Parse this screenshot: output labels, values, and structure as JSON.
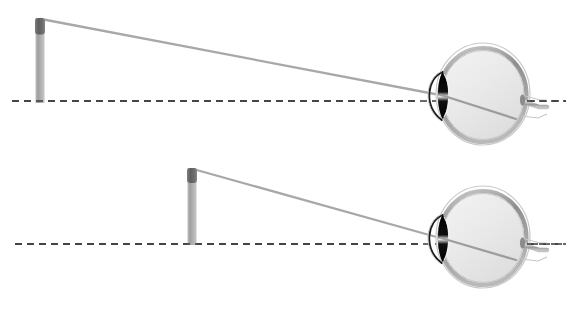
{
  "figure": {
    "background_color": "#ffffff",
    "width": 582,
    "height": 312,
    "panel_count": 2
  },
  "palette": {
    "background": "#ffffff",
    "axis_line": "#3a3a3a",
    "ray_line": "#a8a8a8",
    "object_body": "#a8a8a8",
    "object_cap": "#6b6b6b",
    "sclera_outer": "#b5b5b5",
    "sclera_inner": "#8f8f8f",
    "vitreous_fill": "#ededed",
    "iris_dark": "#111111",
    "cornea_line": "#1a1a1a",
    "optic_nerve": "#9a9a9a"
  },
  "chart_data": {
    "type": "diagram",
    "xlabel": "",
    "ylabel": "",
    "panels": [
      {
        "id": "panel-top",
        "label": "far-object",
        "axis": {
          "name": "optical-axis",
          "style": "dashed",
          "y": 101,
          "x_start": 12,
          "x_end": 566
        },
        "object": {
          "name": "far-object-arrow",
          "x": 40,
          "base_y": 103,
          "tip_y": 18,
          "height_px": 85,
          "distance_label": "far"
        },
        "ray": {
          "name": "chief-ray",
          "from": [
            41,
            19
          ],
          "nodal_point": [
            440,
            95
          ],
          "to": [
            516,
            119
          ]
        },
        "eye": {
          "name": "eye-far",
          "center": [
            483,
            94
          ],
          "radius_x": 47,
          "radius_y": 51
        }
      },
      {
        "id": "panel-bottom",
        "label": "near-object",
        "axis": {
          "name": "optical-axis",
          "style": "dashed",
          "y": 244,
          "x_start": 15,
          "x_end": 566
        },
        "object": {
          "name": "near-object-arrow",
          "x": 192,
          "base_y": 245,
          "tip_y": 168,
          "height_px": 77,
          "distance_label": "near"
        },
        "ray": {
          "name": "chief-ray",
          "from": [
            193,
            169
          ],
          "nodal_point": [
            440,
            238
          ],
          "to": [
            516,
            260
          ]
        },
        "eye": {
          "name": "eye-near",
          "center": [
            483,
            237
          ],
          "radius_x": 47,
          "radius_y": 51
        }
      }
    ],
    "annotations": [],
    "legend": [],
    "grid": false
  },
  "labels": {
    "none_visible": ""
  }
}
